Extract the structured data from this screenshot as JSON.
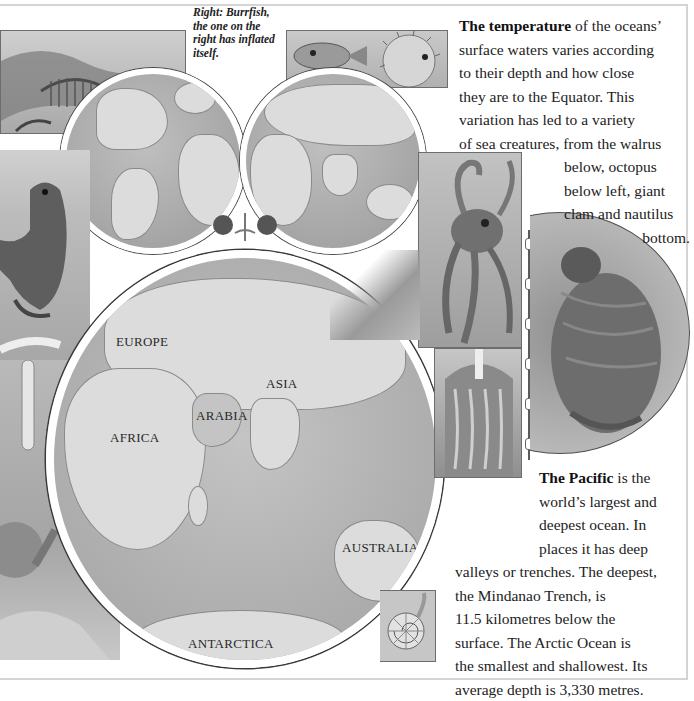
{
  "captions": {
    "burrfish": "Right: Burrfish, the one on the right has inflated itself."
  },
  "temperature_paragraph": {
    "lead": "The temperature",
    "lines": [
      " of the oceans’",
      "surface waters varies according",
      "to their depth and how close",
      "they are to the Equator. This",
      "variation has led to a variety",
      "of sea creatures, from the walrus"
    ],
    "indented_lines": [
      "below, octopus",
      "below left, giant",
      "clam and nautilus",
      "bottom."
    ]
  },
  "pacific_paragraph": {
    "lead": "The Pacific",
    "lines": [
      " is the",
      "world’s largest and",
      "deepest ocean. In",
      "places it has deep"
    ],
    "full_lines": [
      "valleys or trenches. The deepest,",
      "the Mindanao Trench, is",
      "11.5 kilometres below the",
      "surface. The Arctic Ocean is",
      "the smallest and shallowest. Its",
      "average depth is 3,330 metres."
    ]
  },
  "map": {
    "labels": [
      "EUROPE",
      "ASIA",
      "ARABIA",
      "AFRICA",
      "AUSTRALIA",
      "ANTARCTICA"
    ]
  },
  "illustrations": {
    "top_left": "leafy-sea-dragon",
    "top_center": "burrfish",
    "left": "marine-iguana",
    "right_top": "octopus",
    "right_circle": "walrus",
    "right_bottom": "giant-clam",
    "bottom_right": "nautilus",
    "bottom_left": "sea-creature"
  },
  "colors": {
    "page_background": "#ffffff",
    "border": "#d4d4d4",
    "ocean": "#b1b1b1",
    "land": "#dcdcdc",
    "text": "#222222"
  }
}
